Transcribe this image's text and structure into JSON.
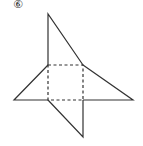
{
  "figure": {
    "label": "⑥",
    "stroke_color": "#333333",
    "square": {
      "x": 48,
      "y": 65,
      "size": 35,
      "style": "dashed"
    },
    "triangles": [
      {
        "name": "top",
        "points": "48,65 48,14 83,65"
      },
      {
        "name": "left",
        "points": "48,65 14,100 48,100"
      },
      {
        "name": "right",
        "points": "83,65 133,100 83,100"
      },
      {
        "name": "bottom",
        "points": "48,100 83,137 83,100"
      }
    ]
  }
}
